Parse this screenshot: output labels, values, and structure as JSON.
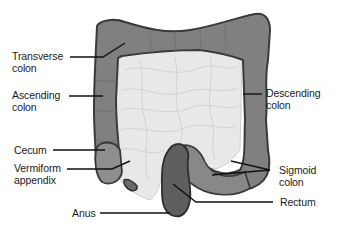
{
  "diagram": {
    "colors": {
      "colon": "#7f7f7f",
      "colon_outline": "#3a3a3a",
      "cecum": "#8e8e8e",
      "sigmoid": "#878787",
      "rectum": "#5e5e5e",
      "small_intestine": "#e6e6e6",
      "leader_line": "#111111",
      "text": "#1a1a1a"
    },
    "labels": {
      "transverse_colon": "Transverse\ncolon",
      "ascending_colon": "Ascending\ncolon",
      "descending_colon": "Descending\ncolon",
      "cecum": "Cecum",
      "vermiform_appendix": "Vermiform\nappendix",
      "sigmoid_colon": "Sigmoid\ncolon",
      "rectum": "Rectum",
      "anus": "Anus"
    }
  }
}
